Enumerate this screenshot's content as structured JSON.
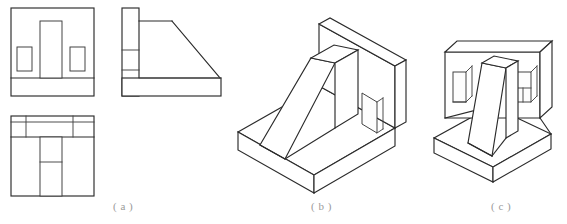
{
  "figure": {
    "background_color": "#ffffff",
    "line_color": "#2b2b2b",
    "caption_color": "#9a9a9a"
  },
  "panels": [
    {
      "id": "a",
      "caption": "( a )",
      "kind": "orthographic-views",
      "description": "Multiview drawing: front view, right side view, top view",
      "views": [
        {
          "name": "front-view",
          "outline": "rectangle with bottom base band",
          "features": [
            "central tall rib rectangle",
            "left pocket rectangle",
            "right pocket rectangle",
            "base band"
          ]
        },
        {
          "name": "right-side-view",
          "outline": "L-shaped profile with inclined rib hypotenuse",
          "features": [
            "vertical wall band divided in three",
            "inclined rib line",
            "horizontal base band"
          ]
        },
        {
          "name": "top-view",
          "outline": "rectangle with upper wall band",
          "features": [
            "wall band with two pocket segments",
            "central rib strip split in two"
          ]
        }
      ]
    },
    {
      "id": "b",
      "caption": "( b )",
      "kind": "isometric-pictorial",
      "description": "Isometric view of angle bracket: horizontal base slab, vertical back wall with rectangular through-hole, and wedge-shaped triangular rib"
    },
    {
      "id": "c",
      "caption": "( c )",
      "kind": "isometric-pictorial",
      "description": "Alternate isometric view of angle bracket: base slab, vertical wall with two rectangular pockets, and central tapered rib"
    }
  ],
  "captions": {
    "a": "( a )",
    "b": "( b )",
    "c": "( c )"
  }
}
